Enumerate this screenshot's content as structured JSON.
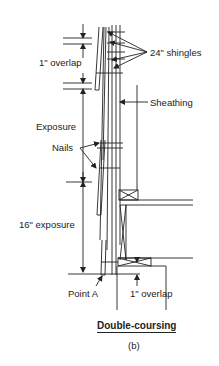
{
  "figure": {
    "title": "Double-coursing",
    "caption": "(b)"
  },
  "labels": {
    "shingles": "24\" shingles",
    "overlap_top": "1\" overlap",
    "sheathing": "Sheathing",
    "exposure": "Exposure",
    "nails": "Nails",
    "exposure_16": "16\" exposure",
    "point_a": "Point A",
    "overlap_bottom": "1\" overlap"
  },
  "colors": {
    "ink": "#222222",
    "background": "#ffffff"
  }
}
